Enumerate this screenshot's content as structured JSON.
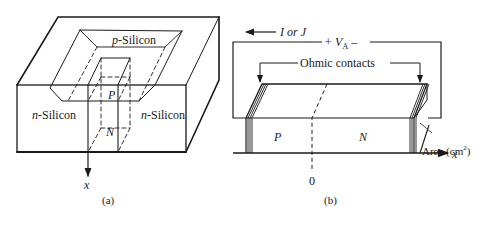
{
  "figure_a": {
    "label_p_silicon_italic": "p",
    "label_p_silicon_rest": "-Silicon",
    "label_n_silicon_left_italic": "n",
    "label_n_silicon_left_rest": "-Silicon",
    "label_n_silicon_right_italic": "n",
    "label_n_silicon_right_rest": "-Silicon",
    "label_P": "P",
    "label_N": "N",
    "axis_label": "x",
    "caption": "(a)"
  },
  "figure_b": {
    "current_label": "I or J",
    "voltage_label_plus": "+ V",
    "voltage_label_sub": "A",
    "voltage_label_minus": " –",
    "ohmic_contacts_label": "Ohmic contacts",
    "label_P": "P",
    "label_N": "N",
    "origin_label": "0",
    "area_label": "Area (cm",
    "area_sup": "2",
    "area_close": ")",
    "axis_label": "x",
    "caption": "(b)"
  },
  "colors": {
    "line": "#1a1a1a",
    "background": "#ffffff"
  }
}
